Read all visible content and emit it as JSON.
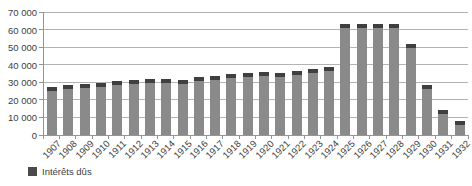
{
  "chart": {
    "legend": {
      "label": "Intérêts dûs"
    },
    "colors": {
      "background": "#ffffff",
      "bar": "#8a8a8a",
      "bar_cap": "#3f3f3f",
      "gridline": "#b3b3b3",
      "axis": "#959595",
      "text": "#404040",
      "legend_swatch": "#4a4a4a"
    }
  },
  "chart_data": {
    "type": "bar",
    "title": "",
    "xlabel": "",
    "ylabel": "",
    "categories": [
      "1907",
      "1908",
      "1909",
      "1910",
      "1911",
      "1912",
      "1913",
      "1914",
      "1915",
      "1916",
      "1917",
      "1918",
      "1919",
      "1920",
      "1921",
      "1922",
      "1923",
      "1924",
      "1925",
      "1926",
      "1927",
      "1928",
      "1929",
      "1930",
      "1931",
      "1932"
    ],
    "series": [
      {
        "name": "Intérêts dûs",
        "values": [
          27500,
          28300,
          29000,
          29800,
          30800,
          31500,
          31800,
          31800,
          31500,
          32800,
          33500,
          34500,
          35200,
          35800,
          35500,
          36500,
          37300,
          38800,
          63000,
          63000,
          63000,
          63000,
          52000,
          28500,
          14000,
          8000
        ]
      }
    ],
    "ylim": [
      0,
      70000
    ],
    "ytick_interval": 10000,
    "ytick_labels": [
      "0",
      "10 000",
      "20 000",
      "30 000",
      "40 000",
      "50 000",
      "60 000",
      "70 000"
    ],
    "grid": true,
    "legend_position": "bottom-left"
  }
}
